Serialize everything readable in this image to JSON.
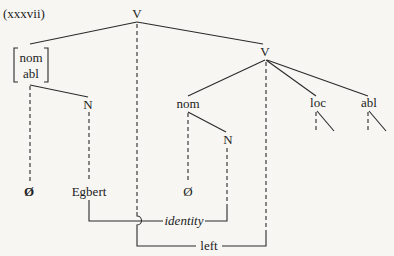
{
  "example_number": "(xxxvii)",
  "nodes": {
    "top_v": "V",
    "bracket_top": "nom",
    "bracket_bottom": "abl",
    "left_n": "N",
    "right_v": "V",
    "right_nom": "nom",
    "right_n": "N",
    "loc": "loc",
    "abl": "abl"
  },
  "terminals": {
    "left_null": "Ø",
    "egbert": "Egbert",
    "right_null": "Ø"
  },
  "relations": {
    "identity": "identity",
    "left": "left"
  },
  "colors": {
    "background": "#f7f6f3",
    "ink": "#2a2a2a"
  }
}
